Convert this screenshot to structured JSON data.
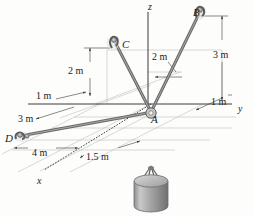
{
  "figure": {
    "type": "engineering-statics-3d-free-body",
    "background_color": "#fdfdfc",
    "line_color": "#3a3a3a",
    "construction_line_color": "#9a9a9a",
    "cable_color": "#6e6e6e",
    "cylinder_color": "#9e9e9e"
  },
  "axes": [
    {
      "name": "z-axis",
      "label": "z",
      "x": 148,
      "y": 2
    },
    {
      "name": "y-axis",
      "label": "y",
      "x": 238,
      "y": 104
    },
    {
      "name": "x-axis",
      "label": "x",
      "x": 37,
      "y": 176
    }
  ],
  "points": [
    {
      "name": "point-a",
      "label": "A",
      "x": 151,
      "y": 114
    },
    {
      "name": "point-b",
      "label": "B",
      "x": 193,
      "y": 7
    },
    {
      "name": "point-c",
      "label": "C",
      "x": 122,
      "y": 39
    },
    {
      "name": "point-d",
      "label": "D",
      "x": 5,
      "y": 133
    }
  ],
  "dimensions": [
    {
      "name": "dim-b-height",
      "label": "3 m",
      "x": 213,
      "y": 50
    },
    {
      "name": "dim-b-offset",
      "label": "1 m",
      "x": 211,
      "y": 97
    },
    {
      "name": "dim-a-to-b-run",
      "label": "2 m",
      "x": 152,
      "y": 52
    },
    {
      "name": "dim-c-height",
      "label": "2 m",
      "x": 68,
      "y": 66
    },
    {
      "name": "dim-c-offset",
      "label": "1 m",
      "x": 36,
      "y": 91
    },
    {
      "name": "dim-d-offset",
      "label": "3 m",
      "x": 18,
      "y": 114
    },
    {
      "name": "dim-d-run",
      "label": "4 m",
      "x": 32,
      "y": 148
    },
    {
      "name": "dim-a-x-offset",
      "label": "1.5 m",
      "x": 86,
      "y": 152
    }
  ]
}
